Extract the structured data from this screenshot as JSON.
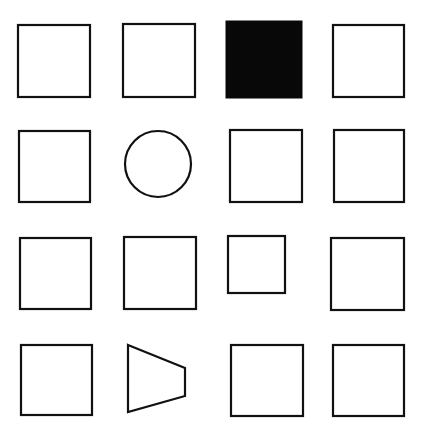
{
  "canvas": {
    "width": 424,
    "height": 436,
    "background_color": "#ffffff",
    "stroke_color": "#111111",
    "fill_color": "#080808",
    "stroke_width": 2.2
  },
  "grid": {
    "rows": 4,
    "columns": 4,
    "total_cells": 16
  },
  "chart_data": {
    "type": "table",
    "title": "",
    "xlabel": "",
    "ylabel": "",
    "grid": true,
    "legend": "none",
    "categories": [
      "column-1",
      "column-2",
      "column-3",
      "column-4"
    ],
    "rows": [
      "row-1",
      "row-2",
      "row-3",
      "row-4"
    ],
    "cells": [
      {
        "row": 1,
        "col": 1,
        "shape": "square",
        "fill": "outline",
        "x": 18,
        "y": 25,
        "w": 72,
        "h": 72
      },
      {
        "row": 1,
        "col": 2,
        "shape": "square",
        "fill": "outline",
        "x": 123,
        "y": 24,
        "w": 72,
        "h": 73
      },
      {
        "row": 1,
        "col": 3,
        "shape": "square",
        "fill": "solid-black",
        "x": 226,
        "y": 21,
        "w": 76,
        "h": 77
      },
      {
        "row": 1,
        "col": 4,
        "shape": "square",
        "fill": "outline",
        "x": 333,
        "y": 25,
        "w": 71,
        "h": 72
      },
      {
        "row": 2,
        "col": 1,
        "shape": "square",
        "fill": "outline",
        "x": 19,
        "y": 131,
        "w": 71,
        "h": 71
      },
      {
        "row": 2,
        "col": 2,
        "shape": "circle",
        "fill": "outline",
        "cx": 158,
        "cy": 164,
        "r": 33
      },
      {
        "row": 2,
        "col": 3,
        "shape": "square",
        "fill": "outline",
        "x": 230,
        "y": 130,
        "w": 72,
        "h": 72
      },
      {
        "row": 2,
        "col": 4,
        "shape": "square",
        "fill": "outline",
        "x": 334,
        "y": 130,
        "w": 70,
        "h": 72
      },
      {
        "row": 3,
        "col": 1,
        "shape": "square",
        "fill": "outline",
        "x": 20,
        "y": 238,
        "w": 71,
        "h": 71
      },
      {
        "row": 3,
        "col": 2,
        "shape": "square",
        "fill": "outline",
        "x": 124,
        "y": 237,
        "w": 72,
        "h": 72
      },
      {
        "row": 3,
        "col": 3,
        "shape": "square",
        "fill": "outline",
        "x": 228,
        "y": 236,
        "w": 57,
        "h": 57
      },
      {
        "row": 3,
        "col": 4,
        "shape": "square",
        "fill": "outline",
        "x": 331,
        "y": 238,
        "w": 73,
        "h": 72
      },
      {
        "row": 4,
        "col": 1,
        "shape": "square",
        "fill": "outline",
        "x": 21,
        "y": 345,
        "w": 71,
        "h": 70
      },
      {
        "row": 4,
        "col": 2,
        "shape": "trapezoid",
        "fill": "outline",
        "points": "128,345 185,368 185,396 128,412"
      },
      {
        "row": 4,
        "col": 3,
        "shape": "square",
        "fill": "outline",
        "x": 231,
        "y": 345,
        "w": 72,
        "h": 71
      },
      {
        "row": 4,
        "col": 4,
        "shape": "square",
        "fill": "outline",
        "x": 333,
        "y": 345,
        "w": 71,
        "h": 71
      }
    ],
    "notes": {
      "odd_one_out_fill": "row-1 column-3 is the only solid black square",
      "odd_one_out_shape_circle": "row-2 column-2 is the only circle",
      "odd_one_out_shape_trapezoid": "row-4 column-2 is the only trapezoid",
      "odd_one_out_size": "row-3 column-3 is the smallest square"
    }
  }
}
